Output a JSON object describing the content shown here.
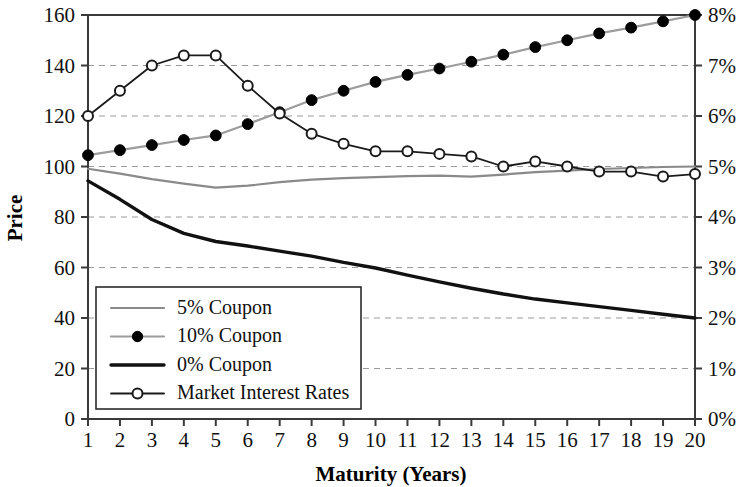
{
  "chart_data": {
    "type": "line",
    "title": "",
    "subtitle": "",
    "xlabel": "Maturity (Years)",
    "ylabel": "Price",
    "y2label": "",
    "x": [
      1,
      2,
      3,
      4,
      5,
      6,
      7,
      8,
      9,
      10,
      11,
      12,
      13,
      14,
      15,
      16,
      17,
      18,
      19,
      20
    ],
    "xticklabels": [
      "1",
      "2",
      "3",
      "4",
      "5",
      "6",
      "7",
      "8",
      "9",
      "10",
      "11",
      "12",
      "13",
      "14",
      "15",
      "16",
      "17",
      "18",
      "19",
      "20"
    ],
    "xlim": [
      1,
      20
    ],
    "ylim": [
      0,
      160
    ],
    "yticks": [
      0,
      20,
      40,
      60,
      80,
      100,
      120,
      140,
      160
    ],
    "yticklabels": [
      "0",
      "20",
      "40",
      "60",
      "80",
      "100",
      "120",
      "140",
      "160"
    ],
    "y2lim": [
      0,
      8
    ],
    "y2ticks": [
      0,
      1,
      2,
      3,
      4,
      5,
      6,
      7,
      8
    ],
    "y2ticklabels": [
      "0%",
      "1%",
      "2%",
      "3%",
      "4%",
      "5%",
      "6%",
      "7%",
      "8%"
    ],
    "grid": true,
    "grid_axis": "y",
    "legend_position": "lower-left",
    "series": [
      {
        "name": "5% Coupon",
        "axis": "left",
        "color": "#8a8a8a",
        "line_width": 2.2,
        "marker": "none",
        "values": [
          99.1,
          97.2,
          95.0,
          93.2,
          91.6,
          92.4,
          93.8,
          94.8,
          95.4,
          95.8,
          96.2,
          96.4,
          96.0,
          96.8,
          97.8,
          98.4,
          99.0,
          99.4,
          99.8,
          100.0
        ]
      },
      {
        "name": "10% Coupon",
        "axis": "left",
        "color": "#9c9c9c",
        "line_width": 2.2,
        "marker": "filled-circle",
        "values": [
          104.5,
          106.5,
          108.5,
          110.5,
          112.3,
          116.8,
          121.5,
          126.3,
          130.0,
          133.5,
          136.3,
          138.8,
          141.5,
          144.3,
          147.3,
          150.0,
          152.7,
          155.0,
          157.5,
          160.0
        ]
      },
      {
        "name": "0% Coupon",
        "axis": "left",
        "color": "#111111",
        "line_width": 3.4,
        "marker": "none",
        "values": [
          94.3,
          87.0,
          79.0,
          73.5,
          70.3,
          68.5,
          66.5,
          64.5,
          62.0,
          59.8,
          57.0,
          54.3,
          51.8,
          49.5,
          47.5,
          46.0,
          44.5,
          43.0,
          41.5,
          40.0
        ]
      },
      {
        "name": "Market Interest Rates",
        "axis": "right",
        "color": "#1a1a1a",
        "line_width": 1.8,
        "marker": "open-circle",
        "values": [
          6.0,
          6.5,
          7.0,
          7.2,
          7.2,
          6.6,
          6.05,
          5.65,
          5.45,
          5.3,
          5.3,
          5.25,
          5.2,
          5.0,
          5.1,
          5.0,
          4.9,
          4.9,
          4.8,
          4.85
        ]
      }
    ],
    "legend": [
      {
        "label": "5% Coupon",
        "style": "gray-line"
      },
      {
        "label": "10% Coupon",
        "style": "gray-line-filled-marker"
      },
      {
        "label": "0% Coupon",
        "style": "black-thick-line"
      },
      {
        "label": "Market Interest Rates",
        "style": "black-line-open-marker"
      }
    ]
  }
}
